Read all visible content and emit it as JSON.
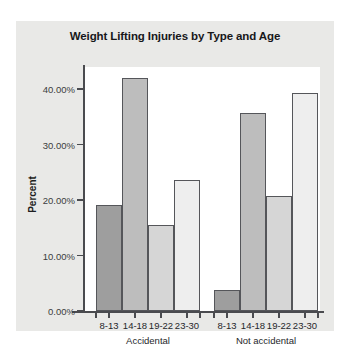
{
  "chart_data": {
    "type": "bar",
    "title": "Weight Lifting Injuries by Type and Age",
    "xlabel": "",
    "ylabel": "Percent",
    "categories": [
      "8-13",
      "14-18",
      "19-22",
      "23-30"
    ],
    "groups": [
      "Accidental",
      "Not accidental"
    ],
    "series": [
      {
        "name": "Accidental",
        "values": [
          19.1,
          42.0,
          15.6,
          23.6
        ]
      },
      {
        "name": "Not accidental",
        "values": [
          3.8,
          35.7,
          20.8,
          39.3
        ]
      }
    ],
    "bars": [
      {
        "group": "Accidental",
        "category": "8-13",
        "value": 19.1,
        "color": "#9e9e9e"
      },
      {
        "group": "Accidental",
        "category": "14-18",
        "value": 42.0,
        "color": "#bdbdbd"
      },
      {
        "group": "Accidental",
        "category": "19-22",
        "value": 15.6,
        "color": "#d6d6d6"
      },
      {
        "group": "Accidental",
        "category": "23-30",
        "value": 23.6,
        "color": "#eeeeee"
      },
      {
        "group": "Not accidental",
        "category": "8-13",
        "value": 3.8,
        "color": "#9e9e9e"
      },
      {
        "group": "Not accidental",
        "category": "14-18",
        "value": 35.7,
        "color": "#bdbdbd"
      },
      {
        "group": "Not accidental",
        "category": "19-22",
        "value": 20.8,
        "color": "#d6d6d6"
      },
      {
        "group": "Not accidental",
        "category": "23-30",
        "value": 39.3,
        "color": "#eeeeee"
      }
    ],
    "ylim": [
      0,
      44
    ],
    "yticks": [
      0,
      10,
      20,
      30,
      40
    ],
    "ytick_labels": [
      "0.00%",
      "10.00%",
      "20.00%",
      "30.00%",
      "40.00%"
    ],
    "grid": false,
    "legend": "none",
    "panel_color": "#e9e9e7",
    "plot_background": "#ffffff",
    "axis_color": "#4a4b4f",
    "bar_edge_color": "#55565a"
  }
}
